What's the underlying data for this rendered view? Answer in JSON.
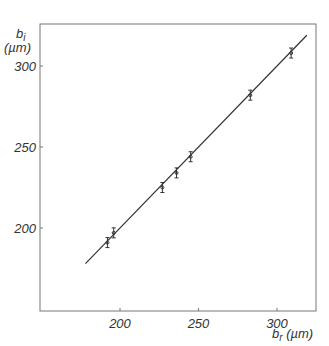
{
  "chart_data": {
    "type": "scatter",
    "title": "",
    "xlabel": "b_r (µm)",
    "ylabel": "b_i (µm)",
    "xlabel_main": "b",
    "xlabel_sub": "r",
    "xlabel_unit": "(µm)",
    "ylabel_main": "b",
    "ylabel_sub": "i",
    "ylabel_unit": "(µm)",
    "xlim": [
      150,
      325
    ],
    "ylim": [
      150,
      325
    ],
    "x_ticks": [
      200,
      250,
      300
    ],
    "y_ticks": [
      200,
      250,
      300
    ],
    "grid": false,
    "series": [
      {
        "name": "measurements",
        "x": [
          192,
          196,
          227,
          236,
          245,
          283,
          309
        ],
        "y": [
          191,
          197,
          225,
          234,
          244,
          282,
          308
        ]
      },
      {
        "name": "fit line",
        "type": "line",
        "x": [
          178,
          319
        ],
        "y": [
          178,
          319
        ]
      }
    ]
  }
}
